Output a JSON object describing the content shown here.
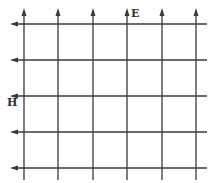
{
  "diagram": {
    "labels": {
      "e_field": "E",
      "h_field": "H"
    },
    "colors": {
      "line": "#3a3a3a",
      "background": "#ffffff"
    },
    "vertical_lines_x": [
      24,
      58,
      93,
      127,
      162,
      196
    ],
    "horizontal_lines_y": [
      24,
      60,
      96,
      132,
      168
    ],
    "vertical_arrow_direction": "up",
    "horizontal_arrow_direction": "left"
  }
}
